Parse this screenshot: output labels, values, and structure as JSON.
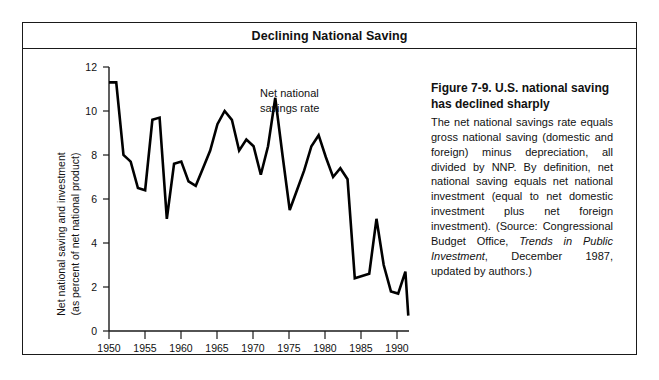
{
  "figure": {
    "title": "Declining National Saving",
    "caption_heading": "Figure 7-9. U.S. national saving has declined sharply",
    "caption_body_part1": "The net national savings rate equals gross national saving (domestic and foreign) minus depreciation, all divided by NNP. By definition, net national saving equals net national investment (equal to net domestic investment plus net foreign investment). (Source: Congressional Budget Office, ",
    "caption_source_italic": "Trends in Public Investment",
    "caption_body_part2": ", December 1987, updated by authors.)"
  },
  "chart_data": {
    "type": "line",
    "title": "Declining National Saving",
    "xlabel": "Year",
    "ylabel_line1": "Net national saving and investment",
    "ylabel_line2": "(as percent of net national product)",
    "annotation_line1": "Net national",
    "annotation_line2": "savings rate",
    "xlim": [
      1950,
      1991.5
    ],
    "ylim": [
      0,
      12
    ],
    "xticks": [
      1950,
      1955,
      1960,
      1965,
      1970,
      1975,
      1980,
      1985,
      1990
    ],
    "yticks": [
      0,
      2,
      4,
      6,
      8,
      10,
      12
    ],
    "grid": false,
    "legend": "none",
    "series_name": "Net national savings rate",
    "line_color": "#000000",
    "x": [
      1950,
      1951,
      1952,
      1953,
      1954,
      1955,
      1956,
      1957,
      1958,
      1959,
      1960,
      1961,
      1962,
      1963,
      1964,
      1965,
      1966,
      1967,
      1968,
      1969,
      1970,
      1971,
      1972,
      1973,
      1974,
      1975,
      1976,
      1977,
      1978,
      1979,
      1980,
      1981,
      1982,
      1983,
      1984,
      1985,
      1986,
      1987,
      1988,
      1989,
      1990,
      1991
    ],
    "values": [
      11.3,
      11.3,
      8.0,
      7.7,
      6.5,
      6.4,
      9.6,
      9.7,
      5.1,
      7.6,
      7.7,
      6.8,
      6.6,
      7.4,
      8.2,
      9.4,
      10.0,
      9.6,
      8.2,
      8.7,
      8.4,
      7.1,
      8.4,
      10.6,
      8.0,
      5.5,
      6.4,
      7.3,
      8.4,
      8.9,
      7.9,
      7.0,
      7.4,
      6.9,
      2.4,
      2.5,
      2.6,
      5.1,
      3.0,
      1.8,
      1.7,
      2.7
    ],
    "values_tail_note": "final point 1991 approximately 0.7"
  }
}
